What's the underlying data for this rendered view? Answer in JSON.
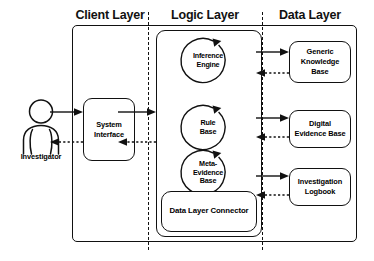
{
  "diagram": {
    "layers": [
      {
        "id": "client",
        "label": "Client Layer"
      },
      {
        "id": "logic",
        "label": "Logic Layer"
      },
      {
        "id": "data",
        "label": "Data Layer"
      }
    ],
    "actor": {
      "label": "Investigator",
      "icon": "person-icon"
    },
    "client_nodes": [
      {
        "id": "system-interface",
        "label": "System\nInterface"
      }
    ],
    "logic_nodes": [
      {
        "id": "inference-engine",
        "label": "Inference\nEngine",
        "shape": "circle-with-loop-arrow"
      },
      {
        "id": "rule-base",
        "label": "Rule\nBase",
        "shape": "circle-with-loop-arrow"
      },
      {
        "id": "meta-evidence-base",
        "label": "Meta-\nEvidence\nBase",
        "shape": "circle-with-loop-arrow"
      },
      {
        "id": "data-layer-connector",
        "label": "Data Layer Connector",
        "shape": "rounded-rect"
      }
    ],
    "data_nodes": [
      {
        "id": "generic-knowledge-base",
        "label": "Generic\nKnowledge\nBase"
      },
      {
        "id": "digital-evidence-base",
        "label": "Digital\nEvidence Base"
      },
      {
        "id": "investigation-logbook",
        "label": "Investigation\nLogbook"
      }
    ],
    "connectors": [
      {
        "from": "investigator",
        "to": "system-interface",
        "style": "solid",
        "direction": "right"
      },
      {
        "from": "system-interface",
        "to": "investigator",
        "style": "dotted",
        "direction": "left"
      },
      {
        "from": "system-interface",
        "to": "logic-layer",
        "style": "solid",
        "direction": "right"
      },
      {
        "from": "logic-layer",
        "to": "system-interface",
        "style": "dotted",
        "direction": "left"
      },
      {
        "from": "logic-layer",
        "to": "generic-knowledge-base",
        "style": "solid",
        "direction": "right"
      },
      {
        "from": "generic-knowledge-base",
        "to": "logic-layer",
        "style": "dotted",
        "direction": "left"
      },
      {
        "from": "logic-layer",
        "to": "digital-evidence-base",
        "style": "solid",
        "direction": "right"
      },
      {
        "from": "digital-evidence-base",
        "to": "logic-layer",
        "style": "dotted",
        "direction": "left"
      },
      {
        "from": "logic-layer",
        "to": "investigation-logbook",
        "style": "solid",
        "direction": "right"
      },
      {
        "from": "investigation-logbook",
        "to": "logic-layer",
        "style": "dotted",
        "direction": "left"
      }
    ],
    "colors": {
      "stroke": "#111111",
      "background": "#ffffff",
      "text": "#000000"
    }
  }
}
